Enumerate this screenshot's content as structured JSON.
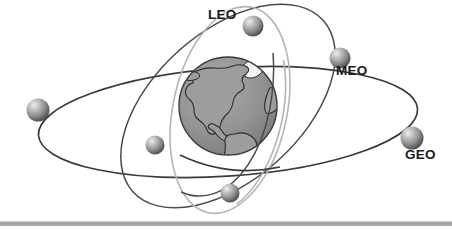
{
  "figure": {
    "background_color": "#ffffff",
    "bottom_bar_color": "#9a9a9a"
  },
  "labels": {
    "leo": "LEO",
    "meo": "MEO",
    "geo": "GEO"
  },
  "earth": {
    "name": "earth-globe",
    "center_x": 228,
    "center_y": 106,
    "radius": 49,
    "ocean_color": "#8a8a8a",
    "land_color": "#9d9d9d",
    "outline_color": "#2b2b2b",
    "ice_color": "#f2f2f2",
    "view": "Americas / North Atlantic"
  },
  "orbits": [
    {
      "id": "leo",
      "name": "LEO",
      "label": "LEO",
      "stroke_color": "#b5b5b5",
      "stroke_width": 1.6,
      "rx": 57,
      "ry": 105,
      "rotation_deg": 12,
      "center_x": 230,
      "center_y": 110,
      "satellite_count": 2
    },
    {
      "id": "meo",
      "name": "MEO",
      "label": "MEO",
      "stroke_color": "#4a4a4a",
      "stroke_width": 1.5,
      "rx": 74,
      "ry": 128,
      "rotation_deg": 48,
      "center_x": 228,
      "center_y": 106,
      "satellite_count": 2
    },
    {
      "id": "geo",
      "name": "GEO",
      "label": "GEO",
      "stroke_color": "#3a3a3a",
      "stroke_width": 1.7,
      "rx": 190,
      "ry": 54,
      "rotation_deg": -4,
      "center_x": 228,
      "center_y": 122,
      "satellite_count": 2
    }
  ],
  "satellites": [
    {
      "id": "sat-leo-top",
      "orbit": "leo",
      "cx": 253,
      "cy": 26,
      "r": 10.5
    },
    {
      "id": "sat-leo-bottom",
      "orbit": "leo",
      "cx": 230,
      "cy": 193,
      "r": 9.5
    },
    {
      "id": "sat-meo-upper",
      "orbit": "meo",
      "cx": 340,
      "cy": 58,
      "r": 10.5
    },
    {
      "id": "sat-meo-lower",
      "orbit": "meo",
      "cx": 155,
      "cy": 145,
      "r": 9.5
    },
    {
      "id": "sat-geo-left",
      "orbit": "geo",
      "cx": 38,
      "cy": 110,
      "r": 11.5
    },
    {
      "id": "sat-geo-right",
      "orbit": "geo",
      "cx": 412,
      "cy": 138,
      "r": 11.5
    }
  ],
  "sphere_style": {
    "highlight_color": "#e8e8e8",
    "mid_color": "#9a9a9a",
    "shadow_color": "#4e4e4e",
    "rim_color": "#6f6f6f"
  }
}
